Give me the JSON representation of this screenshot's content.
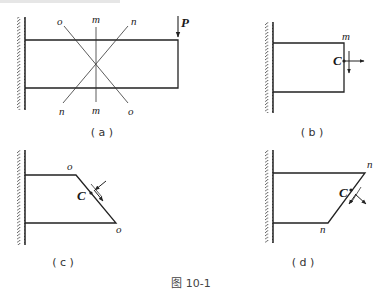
{
  "figure": {
    "caption": "图 10-1",
    "top_strip_note": ""
  },
  "panels": {
    "a": {
      "caption": "( a )",
      "load_label": "P",
      "section_labels_top": [
        "o",
        "m",
        "n"
      ],
      "section_labels_bottom": [
        "n",
        "m",
        "o"
      ]
    },
    "b": {
      "caption": "( b )",
      "section_label": "m",
      "point_label": "C"
    },
    "c": {
      "caption": "( c )",
      "section_label_top": "o",
      "section_label_bottom": "o",
      "point_label": "C"
    },
    "d": {
      "caption": "( d )",
      "section_label_top": "n",
      "section_label_bottom": "n",
      "point_label": "C"
    }
  },
  "colors": {
    "ink": "#222222",
    "background": "#ffffff"
  }
}
